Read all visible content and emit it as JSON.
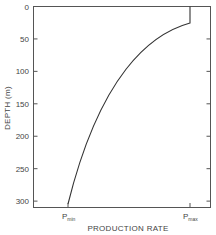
{
  "chart_data": {
    "type": "line",
    "title": "",
    "xlabel": "PRODUCTION RATE",
    "ylabel": "DEPTH (m)",
    "y_axis": {
      "inverted": true,
      "ylim": [
        0,
        312
      ],
      "ticks": [
        0,
        50,
        100,
        150,
        200,
        250,
        300
      ]
    },
    "x_axis": {
      "tick_labels": [
        {
          "main": "P",
          "sub": "min",
          "position": 0.2
        },
        {
          "main": "P",
          "sub": "max",
          "position": 0.885
        }
      ]
    },
    "grid": false,
    "legend": null,
    "series": [
      {
        "name": "production-rate-profile",
        "description": "Production rate constant at Pmax from 0 to ~25 m depth, then decreasing smoothly to Pmin at ~305 m",
        "points": [
          {
            "depth": 0,
            "rate": "Pmax"
          },
          {
            "depth": 25,
            "rate": "Pmax"
          },
          {
            "depth": 40,
            "rate_fraction": 0.82
          },
          {
            "depth": 75,
            "rate_fraction": 0.65
          },
          {
            "depth": 125,
            "rate_fraction": 0.44
          },
          {
            "depth": 175,
            "rate_fraction": 0.27
          },
          {
            "depth": 225,
            "rate_fraction": 0.14
          },
          {
            "depth": 275,
            "rate_fraction": 0.05
          },
          {
            "depth": 305,
            "rate": "Pmin"
          }
        ]
      }
    ]
  }
}
